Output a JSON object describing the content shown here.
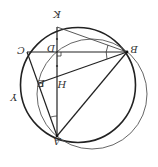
{
  "diagram": {
    "orientation": "rotated 180 degrees",
    "points": {
      "A": {
        "label": "A",
        "x": 57,
        "y": 136
      },
      "B": {
        "label": "B",
        "x": 127,
        "y": 52
      },
      "C": {
        "label": "C",
        "x": 27,
        "y": 52
      },
      "D": {
        "label": "D",
        "x": 57,
        "y": 52
      },
      "E": {
        "label": "E",
        "x": 39,
        "y": 83
      },
      "H": {
        "label": "H",
        "x": 57,
        "y": 80
      },
      "K": {
        "label": "K",
        "x": 57,
        "y": 17
      }
    },
    "circle_label": "Y",
    "segments": [
      "AB",
      "BC",
      "CA",
      "AK",
      "BE",
      "BK"
    ],
    "circles": [
      {
        "name": "circumcircle",
        "cx": 78,
        "cy": 85,
        "r": 57
      },
      {
        "name": "circle-diameter-AB",
        "cx": 92,
        "cy": 94,
        "r": 55
      }
    ],
    "marks": [
      "right-angle-D",
      "right-angle-E",
      "angle-KBC",
      "angle-KAC",
      "tick-DK",
      "tick-DH"
    ]
  }
}
